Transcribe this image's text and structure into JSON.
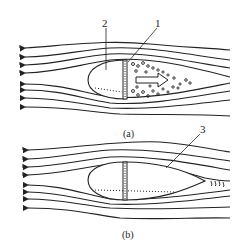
{
  "figure": {
    "panels": [
      {
        "caption": "(a)",
        "labels": [
          {
            "text": "2",
            "meaning": "streamlined body (front part)"
          },
          {
            "text": "1",
            "meaning": "flat rear face with turbulent wake"
          }
        ]
      },
      {
        "caption": "(b)",
        "labels": [
          {
            "text": "3",
            "meaning": "streamlined tail fairing"
          }
        ]
      }
    ],
    "colors": {
      "line": "#222222",
      "background": "#ffffff"
    }
  }
}
